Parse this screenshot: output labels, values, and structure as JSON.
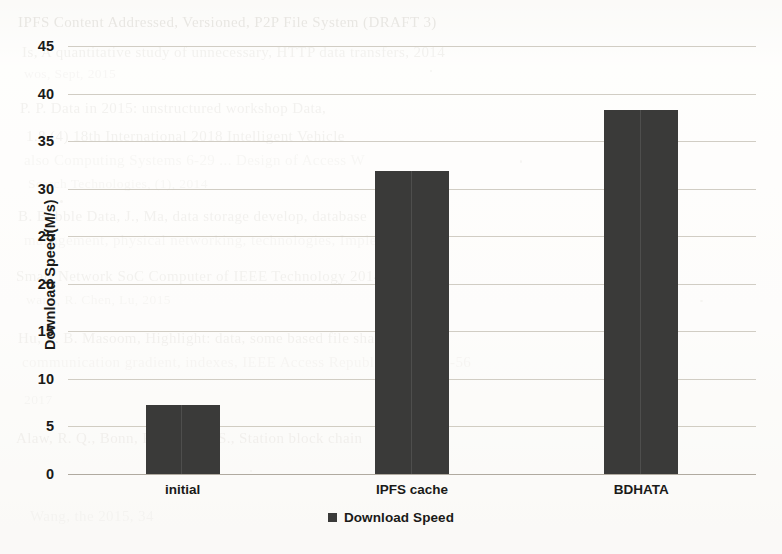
{
  "chart_data": {
    "type": "bar",
    "title": "",
    "xlabel": "",
    "ylabel": "Download Speed(M/s)",
    "categories": [
      "initial",
      "IPFS cache",
      "BDHATA"
    ],
    "series": [
      {
        "name": "Download Speed",
        "values": [
          7.3,
          31.9,
          38.3
        ]
      }
    ],
    "values": [
      7.3,
      31.9,
      38.3
    ],
    "ylim": [
      0,
      45
    ],
    "ytick_labels": [
      "0",
      "5",
      "10",
      "15",
      "20",
      "25",
      "30",
      "35",
      "40",
      "45"
    ],
    "ytick_values": [
      0,
      5,
      10,
      15,
      20,
      25,
      30,
      35,
      40,
      45
    ],
    "grid": true,
    "legend": {
      "position": "bottom",
      "entries": [
        "Download Speed"
      ]
    },
    "bar_color": "#3a3a39",
    "gridline_color": "#c9c4ba"
  },
  "legend": {
    "label": "Download Speed",
    "swatch_name": "legend-swatch"
  },
  "background_scan": {
    "description": "faint scanned journal reference text behind the chart",
    "lines": [
      "IPFS Content Addressed, Versioned, P2P File System (DRAFT 3)",
      "Is, A quantitative study of unnecessary, HTTP data transfers, 2014",
      "wos, Sept, 2015",
      "P.   P.   Data in 2015: unstructured workshop Data,",
      "1.8 (4)  18th  International  2018  Intelligent  Vehicle",
      "also Computing Systems  6-29 ... Design of Access W",
      "Search Technologies, (1), 2014",
      "B.  Bubble Data, J., Ma, data storage develop,  database",
      "management, physical networking, technologies, Implementation",
      "Smart Network SoC Computer of  IEEE  Technology  2014: 19",
      "wang, R. Chen, Lu, 2015",
      "Hu, L. B.  Masoom, Highlight: data, some  based file sharing",
      "communication gradient, indexes, IEEE Access Republic,  2014, 46-56",
      "2017",
      "Alaw, R. Q., Bonn, F. J, Marco  S., Station  block chain",
      "Wang, the 2015, 34"
    ]
  }
}
